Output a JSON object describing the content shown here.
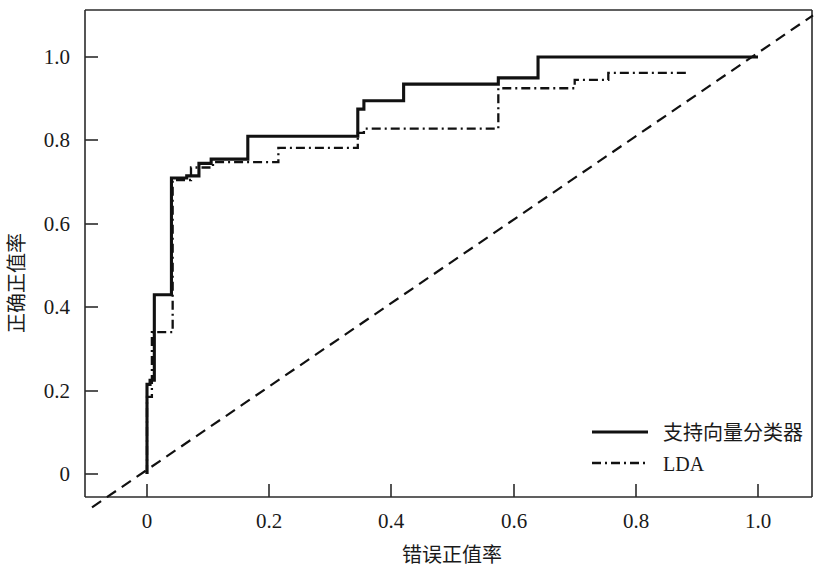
{
  "chart_data": {
    "type": "line",
    "title": "",
    "xlabel": "错误正值率",
    "ylabel": "正确正值率",
    "xlim": [
      -0.09,
      1.09
    ],
    "ylim": [
      -0.08,
      1.1
    ],
    "grid": false,
    "legend_position": "bottom-right",
    "x_ticks": [
      0,
      0.2,
      0.4,
      0.6,
      0.8,
      1.0
    ],
    "x_tick_labels": [
      "0",
      "0.2",
      "0.4",
      "0.6",
      "0.8",
      "1.0"
    ],
    "y_ticks": [
      0,
      0.2,
      0.4,
      0.6,
      0.8,
      1.0
    ],
    "y_tick_labels": [
      "0",
      "0.2",
      "0.4",
      "0.6",
      "0.8",
      "1.0"
    ],
    "series": [
      {
        "name": "支持向量分类器",
        "style": "solid",
        "color": "#111111",
        "x": [
          0,
          0,
          0.005,
          0.005,
          0.012,
          0.012,
          0.04,
          0.04,
          0.065,
          0.065,
          0.085,
          0.085,
          0.105,
          0.105,
          0.165,
          0.165,
          0.345,
          0.345,
          0.355,
          0.355,
          0.42,
          0.42,
          0.575,
          0.575,
          0.64,
          0.64,
          1.0
        ],
        "y": [
          0,
          0.215,
          0.215,
          0.225,
          0.225,
          0.43,
          0.43,
          0.71,
          0.71,
          0.715,
          0.715,
          0.745,
          0.745,
          0.755,
          0.755,
          0.81,
          0.81,
          0.875,
          0.875,
          0.895,
          0.895,
          0.935,
          0.935,
          0.95,
          0.95,
          1.0,
          1.0
        ]
      },
      {
        "name": "LDA",
        "style": "dashdot",
        "color": "#111111",
        "x": [
          0,
          0,
          0.008,
          0.008,
          0.042,
          0.042,
          0.072,
          0.072,
          0.108,
          0.108,
          0.215,
          0.215,
          0.345,
          0.345,
          0.355,
          0.355,
          0.575,
          0.575,
          0.7,
          0.7,
          0.755,
          0.755,
          0.885
        ],
        "y": [
          0,
          0.185,
          0.185,
          0.34,
          0.34,
          0.705,
          0.705,
          0.735,
          0.735,
          0.748,
          0.748,
          0.782,
          0.782,
          0.818,
          0.818,
          0.828,
          0.828,
          0.925,
          0.925,
          0.945,
          0.945,
          0.962,
          0.962
        ]
      },
      {
        "name": "reference-diagonal",
        "style": "dashed",
        "color": "#111111",
        "x": [
          -0.09,
          1.09
        ],
        "y": [
          -0.08,
          1.1
        ]
      }
    ]
  },
  "axes": {
    "x_title": "错误正值率",
    "y_title": "正确正值率"
  },
  "legend": {
    "entries": [
      {
        "label": "支持向量分类器",
        "style": "solid"
      },
      {
        "label": "LDA",
        "style": "dashdot"
      }
    ]
  }
}
